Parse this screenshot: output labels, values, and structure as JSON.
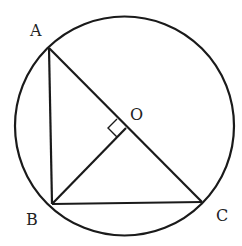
{
  "diagram": {
    "type": "geometry",
    "stroke_color": "#1a1a1a",
    "circle": {
      "center_label": "O"
    },
    "points": {
      "A": {
        "label": "A"
      },
      "B": {
        "label": "B"
      },
      "C": {
        "label": "C"
      },
      "O": {
        "label": "O"
      }
    },
    "segments": [
      "AB",
      "AC",
      "BC",
      "BO"
    ],
    "right_angle_at": "O"
  }
}
